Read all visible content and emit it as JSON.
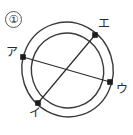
{
  "figure": {
    "item_number": "①",
    "stroke_color": "#3a3a3a",
    "marker_color": "#1c1c1c",
    "background_color": "#ffffff",
    "outer_circle": {
      "cx": 67.5,
      "cy": 69.5,
      "rx": 45.5,
      "ry": 47.5,
      "rotation": -18
    },
    "inner_circle": {
      "cx": 67.5,
      "cy": 70.5,
      "rx": 36.0,
      "ry": 37.5,
      "rotation": -18
    },
    "points": [
      {
        "key": "a",
        "label": "ア",
        "x": 23,
        "y": 57,
        "label_x": 6,
        "label_y": 46
      },
      {
        "key": "i",
        "label": "イ",
        "x": 38,
        "y": 103,
        "label_x": 29,
        "label_y": 107
      },
      {
        "key": "u",
        "label": "ウ",
        "x": 110,
        "y": 82,
        "label_x": 116,
        "label_y": 83
      },
      {
        "key": "e",
        "label": "エ",
        "x": 95,
        "y": 35,
        "label_x": 98,
        "label_y": 18
      }
    ],
    "chords": [
      {
        "key": "chord-a-u",
        "from": "a",
        "to": "u",
        "x1": 23,
        "y1": 57,
        "x2": 110,
        "y2": 82
      },
      {
        "key": "chord-i-e",
        "from": "i",
        "to": "e",
        "x1": 38,
        "y1": 103,
        "x2": 95,
        "y2": 35
      }
    ]
  }
}
